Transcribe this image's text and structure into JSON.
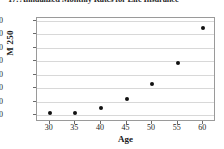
{
  "chart_data": {
    "type": "scatter",
    "title": "17. Annualized Monthly Rates for Life Insurance",
    "xlabel": "Age",
    "ylabel": "M 250",
    "x": [
      30,
      35,
      40,
      45,
      50,
      55,
      60
    ],
    "values": [
      11.5,
      11.5,
      15,
      22,
      33,
      49,
      74.5
    ],
    "series": [
      {
        "name": "M 250",
        "values": [
          11.5,
          11.5,
          15,
          22,
          33,
          49,
          74.5
        ]
      }
    ],
    "xlim": [
      27.5,
      62.5
    ],
    "ylim": [
      5,
      82
    ],
    "xticks": [
      30,
      35,
      40,
      45,
      50,
      55,
      60
    ],
    "yticks": [
      10,
      20,
      30,
      40,
      50,
      60,
      70,
      80
    ],
    "grid": "horizontal",
    "legend": "none",
    "marker_color": "#111111",
    "gridline_color": "#d8d8d8",
    "axis_color": "#9a9a9a"
  }
}
